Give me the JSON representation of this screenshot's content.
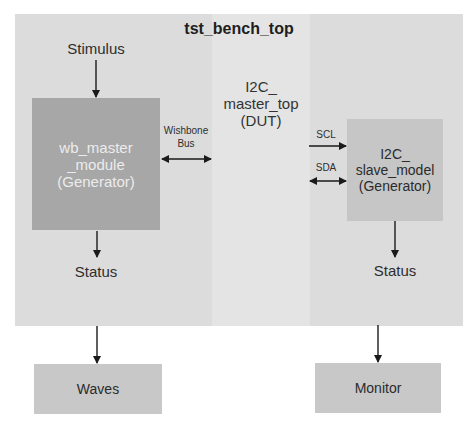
{
  "diagram": {
    "title": "tst_bench_top",
    "stimulus_label": "Stimulus",
    "wb_master": {
      "line1": "wb_master",
      "line2": "_module",
      "line3": "(Generator)"
    },
    "wishbone": {
      "line1": "Wishbone",
      "line2": "Bus"
    },
    "dut": {
      "line1": "I2C_",
      "line2": "master_top",
      "line3": "(DUT)"
    },
    "scl_label": "SCL",
    "sda_label": "SDA",
    "slave": {
      "line1": "I2C_",
      "line2": "slave_model",
      "line3": "(Generator)"
    },
    "status_left": "Status",
    "status_right": "Status",
    "waves_label": "Waves",
    "monitor_label": "Monitor"
  },
  "colors": {
    "container": "#dcdcdc",
    "dut_band": "#e4e4e4",
    "wb_master_box": "#a7a7a7",
    "slave_box": "#c6c6c6",
    "output_box": "#c8c8c8",
    "arrow": "#1a1a1a"
  }
}
